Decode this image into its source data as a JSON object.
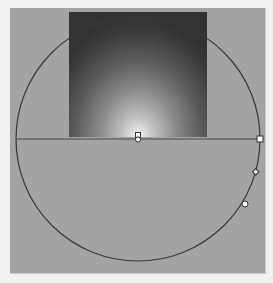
{
  "editor": {
    "type": "radial-gradient-annotator",
    "panel_color": "#a3a3a3",
    "background_color": "#f1f1f1",
    "gradient": {
      "inner_color": "#f2f2f2",
      "outer_color": "#333333",
      "shape": "radial"
    },
    "ring": {
      "center_x": 138,
      "center_y": 139,
      "radius": 122,
      "stroke": "#3a3a3a"
    },
    "axis_line": {
      "x1": 16,
      "x2": 260,
      "y": 139,
      "stroke": "#4a4a4a"
    },
    "handles": [
      {
        "name": "center-handle",
        "x": 138,
        "y": 139,
        "shape": "circle"
      },
      {
        "name": "focal-point-handle",
        "x": 138,
        "y": 135,
        "shape": "square"
      },
      {
        "name": "radius-handle",
        "x": 260,
        "y": 139,
        "shape": "square"
      },
      {
        "name": "angle-handle",
        "x": 256,
        "y": 172,
        "shape": "diamond"
      },
      {
        "name": "aspect-handle",
        "x": 245,
        "y": 204,
        "shape": "circle"
      }
    ]
  }
}
